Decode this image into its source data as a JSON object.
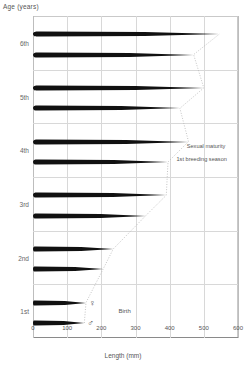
{
  "chart_data": {
    "type": "bar",
    "title": "",
    "xlabel": "Length (mm)",
    "ylabel": "Age (years)",
    "xlim": [
      0,
      600
    ],
    "ylim_categories": [
      "1st",
      "2nd",
      "3rd",
      "4th",
      "5th",
      "6th"
    ],
    "xticks": [
      0,
      100,
      200,
      300,
      400,
      500,
      600
    ],
    "grid": true,
    "legend": "none",
    "categories": [
      "1st",
      "2nd",
      "3rd",
      "4th",
      "5th",
      "6th"
    ],
    "series": [
      {
        "name": "female",
        "symbol": "♀",
        "values": [
          155,
          235,
          390,
          455,
          500,
          545
        ]
      },
      {
        "name": "male",
        "symbol": "♂",
        "values": [
          150,
          205,
          330,
          395,
          430,
          470
        ]
      }
    ],
    "annotations": [
      {
        "label": "Sexual maturity",
        "x": 450,
        "category": "4th"
      },
      {
        "label": "1st breeding season",
        "x": 440,
        "category": "4th"
      },
      {
        "label": "Birth",
        "x": 250,
        "category": "1st"
      }
    ],
    "growth_curve": {
      "description": "dotted curve tracing tip of each body length",
      "points": [
        [
          150,
          1
        ],
        [
          205,
          2
        ],
        [
          330,
          3
        ],
        [
          395,
          4
        ],
        [
          430,
          5
        ],
        [
          470,
          6
        ],
        [
          545,
          6
        ]
      ]
    }
  },
  "axis": {
    "y_title": "Age (years)",
    "x_title": "Length (mm)",
    "x_tick_labels": [
      "0",
      "100",
      "200",
      "300",
      "400",
      "500",
      "600"
    ],
    "y_tick_labels": [
      "6th",
      "5th",
      "4th",
      "3rd",
      "2nd",
      "1st"
    ]
  },
  "annotations": {
    "sexual_maturity": "Sexual maturity",
    "first_breeding_season": "1st breeding season",
    "birth": "Birth"
  },
  "symbols": {
    "female": "♀",
    "male": "♂"
  },
  "colors": {
    "body": "#111111",
    "grid": "#d8d8d8",
    "axis": "#8a8a8a",
    "text": "#555555"
  }
}
